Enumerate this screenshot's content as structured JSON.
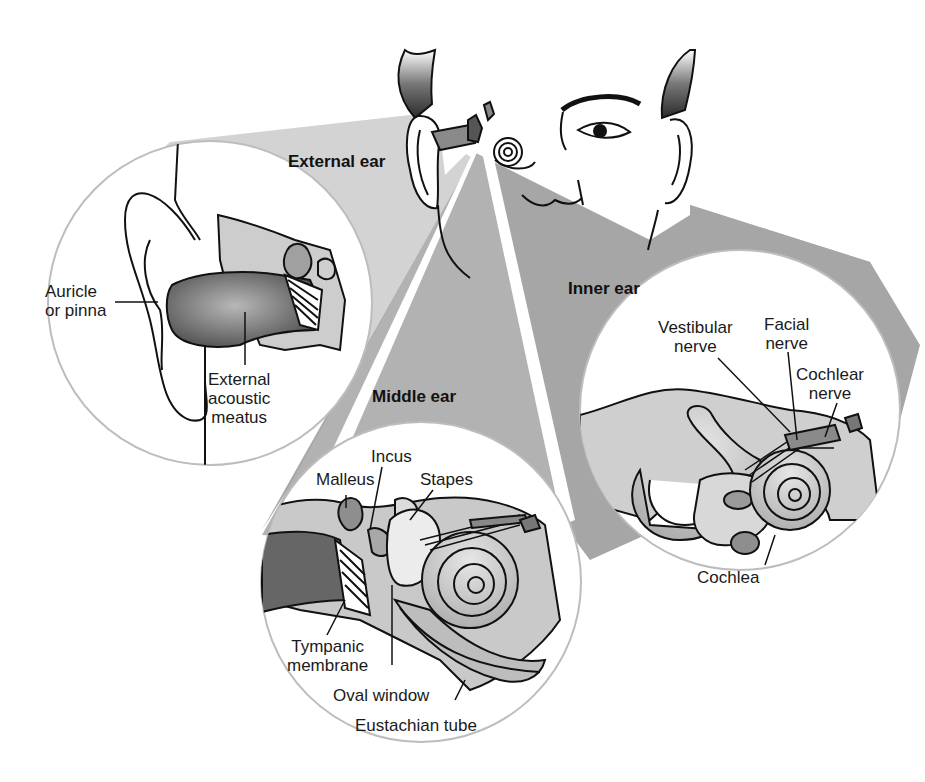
{
  "diagram": {
    "colors": {
      "background": "#ffffff",
      "beam_light": "#d4d4d4",
      "beam_dark": "#a9a9a9",
      "tissue": "#c8c8c8",
      "canal": "#6e6e6e",
      "outline": "#111111",
      "inset_border": "#bdbdbd"
    },
    "sections": {
      "external": "External ear",
      "middle": "Middle ear",
      "inner": "Inner ear"
    },
    "labels": {
      "external": {
        "auricle": "Auricle\nor pinna",
        "meatus": "External\nacoustic\nmeatus"
      },
      "middle": {
        "incus": "Incus",
        "malleus": "Malleus",
        "stapes": "Stapes",
        "tympanic": "Tympanic\nmembrane",
        "oval_window": "Oval window",
        "eustachian": "Eustachian tube"
      },
      "inner": {
        "vestibular": "Vestibular\nnerve",
        "facial": "Facial\nnerve",
        "cochlear_nerve": "Cochlear\nnerve",
        "cochlea": "Cochlea"
      }
    }
  }
}
